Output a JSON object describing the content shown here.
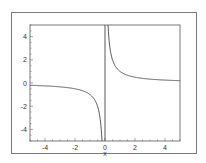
{
  "chart_data": {
    "type": "line",
    "title": "",
    "xlabel": "x",
    "ylabel": "",
    "xlim": [
      -5,
      5
    ],
    "ylim": [
      -5,
      5
    ],
    "x_ticks": [
      -4,
      -2,
      0,
      2,
      4
    ],
    "y_ticks": [
      4,
      2,
      0,
      -2,
      -4
    ],
    "x_tick_labels": [
      "-4",
      "-2",
      "0",
      "2",
      "4"
    ],
    "y_tick_labels": [
      "4",
      "2",
      "0",
      "-2",
      "-4"
    ],
    "grid": false,
    "legend": null,
    "series": [
      {
        "name": "y = 1/x",
        "x": [
          -5,
          -4,
          -3,
          -2,
          -1.5,
          -1,
          -0.7,
          -0.5,
          -0.4,
          -0.3,
          -0.25,
          -0.2,
          0.2,
          0.25,
          0.3,
          0.4,
          0.5,
          0.7,
          1,
          1.5,
          2,
          3,
          4,
          5
        ],
        "y": [
          -0.2,
          -0.25,
          -0.333,
          -0.5,
          -0.667,
          -1,
          -1.429,
          -2,
          -2.5,
          -3.333,
          -4,
          -5,
          5,
          4,
          3.333,
          2.5,
          2,
          1.429,
          1,
          0.667,
          0.5,
          0.333,
          0.25,
          0.2
        ]
      }
    ],
    "annotations": [
      {
        "type": "vertical_line",
        "x": 0
      }
    ],
    "line_color": "#444444"
  }
}
